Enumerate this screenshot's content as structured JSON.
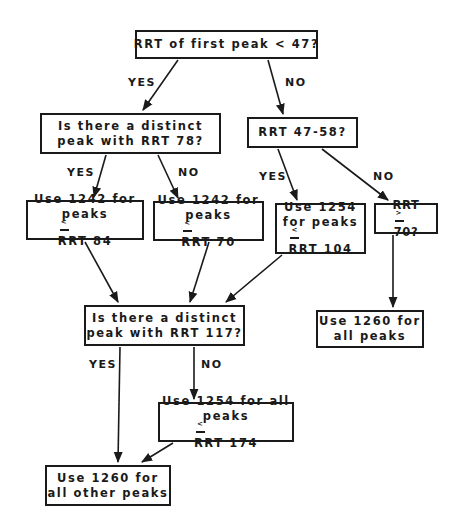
{
  "diagram": {
    "type": "flowchart",
    "nodes": {
      "q_first_peak": {
        "text": [
          "RRT of first peak < 47?"
        ]
      },
      "q_peak78": {
        "text": [
          "Is there a distinct",
          "peak with RRT 78?"
        ]
      },
      "q_rrt4758": {
        "text": [
          "RRT 47-58?"
        ]
      },
      "a_1242_84": {
        "line1": "Use 1242 for",
        "line2_pre": "peaks",
        "sym": "<",
        "line2_post": "RRT 84"
      },
      "a_1242_70": {
        "line1": "Use 1242 for",
        "line2_pre": "peaks",
        "sym": "<",
        "line2_post": "RRT 70"
      },
      "a_1254_104": {
        "line1": "Use 1254",
        "line2": "for peaks",
        "sym": "<",
        "line3_post": "RRT 104"
      },
      "q_rrt70": {
        "pre": "RRT",
        "sym": ">",
        "post": "70?"
      },
      "q_peak117": {
        "text": [
          "Is there a distinct",
          "peak with RRT 117?"
        ]
      },
      "a_1260_all": {
        "text": [
          "Use 1260 for",
          "all peaks"
        ]
      },
      "a_1254_174": {
        "line1": "Use 1254 for all",
        "line2_pre": "peaks",
        "sym": "<",
        "line2_post": "RRT 174"
      },
      "a_1260_other": {
        "text": [
          "Use 1260 for",
          "all other peaks"
        ]
      }
    },
    "edge_labels": {
      "first_yes": "YES",
      "first_no": "NO",
      "p78_yes": "YES",
      "p78_no": "NO",
      "r4758_yes": "YES",
      "r4758_no": "NO",
      "p117_yes": "YES",
      "p117_no": "NO"
    },
    "edges": [
      {
        "from": "q_first_peak",
        "to": "q_peak78",
        "label": "YES"
      },
      {
        "from": "q_first_peak",
        "to": "q_rrt4758",
        "label": "NO"
      },
      {
        "from": "q_peak78",
        "to": "a_1242_84",
        "label": "YES"
      },
      {
        "from": "q_peak78",
        "to": "a_1242_70",
        "label": "NO"
      },
      {
        "from": "q_rrt4758",
        "to": "a_1254_104",
        "label": "YES"
      },
      {
        "from": "q_rrt4758",
        "to": "q_rrt70",
        "label": "NO"
      },
      {
        "from": "a_1242_84",
        "to": "q_peak117",
        "label": ""
      },
      {
        "from": "a_1242_70",
        "to": "q_peak117",
        "label": ""
      },
      {
        "from": "a_1254_104",
        "to": "q_peak117",
        "label": ""
      },
      {
        "from": "q_rrt70",
        "to": "a_1260_all",
        "label": ""
      },
      {
        "from": "q_peak117",
        "to": "a_1260_other",
        "label": "YES"
      },
      {
        "from": "q_peak117",
        "to": "a_1254_174",
        "label": "NO"
      },
      {
        "from": "a_1254_174",
        "to": "a_1260_other",
        "label": ""
      }
    ],
    "colors": {
      "ink": "#1a1a1a",
      "background": "#ffffff"
    }
  }
}
